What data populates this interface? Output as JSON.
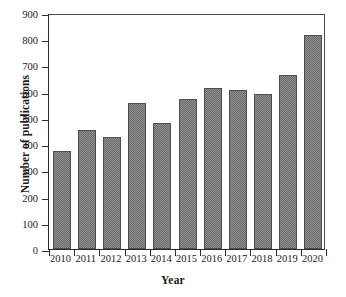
{
  "chart_data": {
    "type": "bar",
    "title": "",
    "xlabel": "Year",
    "ylabel": "Number of publications",
    "categories": [
      "2010",
      "2011",
      "2012",
      "2013",
      "2014",
      "2015",
      "2016",
      "2017",
      "2018",
      "2019",
      "2020"
    ],
    "values": [
      375,
      453,
      427,
      555,
      480,
      573,
      615,
      607,
      592,
      662,
      815
    ],
    "ylim": [
      0,
      900
    ],
    "ytick_interval": 100,
    "yticks": [
      "0",
      "100",
      "200",
      "300",
      "400",
      "500",
      "600",
      "700",
      "800",
      "900"
    ],
    "grid": false,
    "legend": null,
    "legend_position": "none",
    "bar_fill_color": "#8d8d8d",
    "bar_edge_color": "#4d4d4d",
    "axis_color": "#2b2b2b",
    "background_color": "#ffffff"
  }
}
